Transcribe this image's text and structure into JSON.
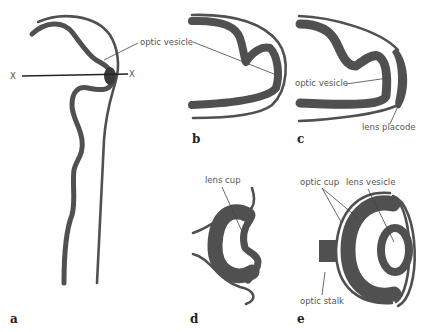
{
  "figure": {
    "colors": {
      "tissue": "#505050",
      "background": "#ffffff",
      "label_text": "#555555",
      "leader": "#444444"
    },
    "panels": [
      {
        "id": "a",
        "letter": "a",
        "labels": [
          "optic vesicle",
          "X",
          "X"
        ]
      },
      {
        "id": "b",
        "letter": "b",
        "labels": [
          "optic vesicle"
        ]
      },
      {
        "id": "c",
        "letter": "c",
        "labels": [
          "optic vesicle",
          "lens placode"
        ]
      },
      {
        "id": "d",
        "letter": "d",
        "labels": [
          "lens cup"
        ]
      },
      {
        "id": "e",
        "letter": "e",
        "labels": [
          "optic cup",
          "lens vesicle",
          "optic stalk"
        ]
      }
    ],
    "labels": {
      "a_optic_vesicle": "optic vesicle",
      "a_x_left": "X",
      "a_x_right": "X",
      "c_optic_vesicle": "optic vesicle",
      "c_lens_placode": "lens placode",
      "d_lens_cup": "lens cup",
      "e_optic_cup": "optic cup",
      "e_lens_vesicle": "lens vesicle",
      "e_optic_stalk": "optic stalk"
    }
  }
}
